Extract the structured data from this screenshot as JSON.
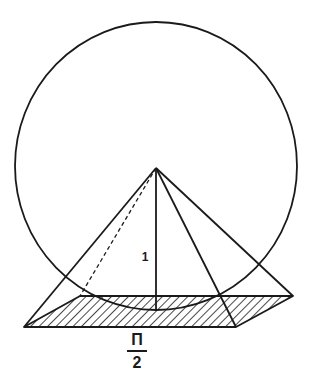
{
  "diagram": {
    "title": "",
    "labels": {
      "height": "1",
      "base_numerator": "Π",
      "base_denominator": "2"
    },
    "colors": {
      "stroke": "#1a1a1a",
      "background": "#ffffff"
    },
    "shapes": {
      "circle": {
        "cx": 156,
        "cy": 166,
        "rx": 141,
        "ry": 144
      },
      "apex": [
        156,
        168
      ],
      "base": {
        "front_left": [
          24,
          327
        ],
        "front_right": [
          236,
          327
        ],
        "back_right": [
          293,
          296
        ],
        "back_left": [
          80,
          296
        ]
      },
      "height_foot": [
        156,
        311
      ]
    }
  }
}
